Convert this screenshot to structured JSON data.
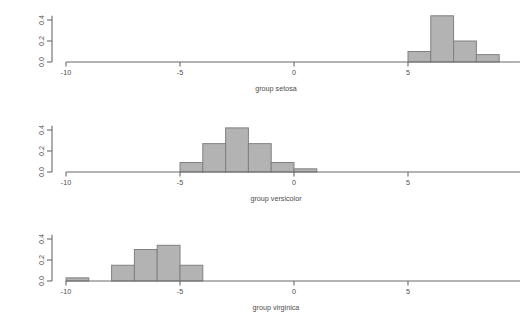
{
  "figure": {
    "background_color": "#ffffff",
    "bar_fill_color": "#b3b3b3",
    "bar_border_color": "#808080",
    "axis_color": "#6b6b6b",
    "text_color": "#4d4d4d"
  },
  "chart_data": [
    {
      "type": "bar",
      "title": "",
      "xlabel": "group setosa",
      "ylabel": "Density",
      "xlim": [
        -10.5,
        10.0
      ],
      "ylim": [
        0.0,
        0.45
      ],
      "xticks": [
        -10,
        -5,
        0,
        5
      ],
      "xticklabels": [
        "-10",
        "-5",
        "0",
        "5"
      ],
      "yticks": [
        0.0,
        0.2,
        0.4
      ],
      "yticklabels": [
        "0.0",
        "0.2",
        "0.4"
      ],
      "grid": false,
      "legend": "none",
      "bin_edges": [
        5,
        6,
        7,
        8,
        9
      ],
      "bin_labels": [
        "5 to 6",
        "6 to 7",
        "7 to 8",
        "8 to 9"
      ],
      "values": [
        0.1,
        0.44,
        0.2,
        0.07
      ]
    },
    {
      "type": "bar",
      "title": "",
      "xlabel": "group versicolor",
      "ylabel": "Density",
      "xlim": [
        -10.5,
        10.0
      ],
      "ylim": [
        0.0,
        0.45
      ],
      "xticks": [
        -10,
        -5,
        0,
        5
      ],
      "xticklabels": [
        "-10",
        "-5",
        "0",
        "5"
      ],
      "yticks": [
        0.0,
        0.2,
        0.4
      ],
      "yticklabels": [
        "0.0",
        "0.2",
        "0.4"
      ],
      "grid": false,
      "legend": "none",
      "bin_edges": [
        -5,
        -4,
        -3,
        -2,
        -1,
        0,
        1
      ],
      "bin_labels": [
        "-5 to -4",
        "-4 to -3",
        "-3 to -2",
        "-2 to -1",
        "-1 to 0",
        "0 to 1"
      ],
      "values": [
        0.09,
        0.27,
        0.42,
        0.27,
        0.09,
        0.03
      ]
    },
    {
      "type": "bar",
      "title": "",
      "xlabel": "group virginica",
      "ylabel": "Density",
      "xlim": [
        -10.5,
        10.0
      ],
      "ylim": [
        0.0,
        0.45
      ],
      "xticks": [
        -10,
        -5,
        0,
        5
      ],
      "xticklabels": [
        "-10",
        "-5",
        "0",
        "5"
      ],
      "yticks": [
        0.0,
        0.2,
        0.4
      ],
      "yticklabels": [
        "0.0",
        "0.2",
        "0.4"
      ],
      "grid": false,
      "legend": "none",
      "bin_edges": [
        -10,
        -9,
        -8,
        -7,
        -6,
        -5,
        -4
      ],
      "bin_labels": [
        "-10 to -9",
        "-9 to -8",
        "-8 to -7",
        "-7 to -6",
        "-6 to -5",
        "-5 to -4"
      ],
      "values": [
        0.03,
        0.0,
        0.15,
        0.3,
        0.34,
        0.15
      ]
    }
  ],
  "panels": [
    {
      "name": "setosa",
      "xlabel": "group setosa",
      "yticklabels": [
        "0.4",
        "0.2",
        "0.0"
      ],
      "xticklabels": [
        "-10",
        "-5",
        "0",
        "5"
      ]
    },
    {
      "name": "versicolor",
      "xlabel": "group versicolor",
      "yticklabels": [
        "0.4",
        "0.2",
        "0.0"
      ],
      "xticklabels": [
        "-10",
        "-5",
        "0",
        "5"
      ]
    },
    {
      "name": "virginica",
      "xlabel": "group virginica",
      "yticklabels": [
        "0.4",
        "0.2",
        "0.0"
      ],
      "xticklabels": [
        "-10",
        "-5",
        "0",
        "5"
      ]
    }
  ]
}
